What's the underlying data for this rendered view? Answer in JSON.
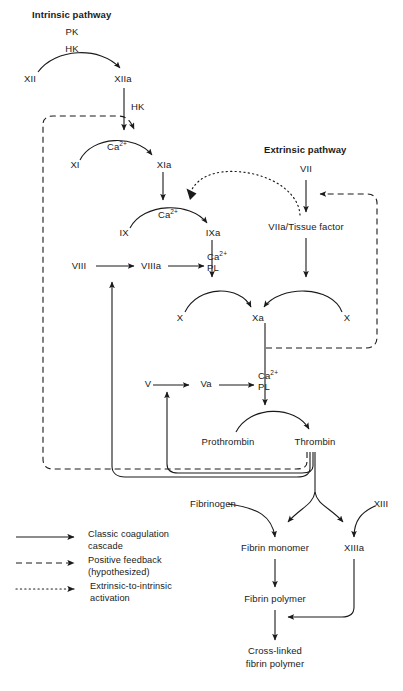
{
  "figure": {
    "type": "flow-diagram",
    "headings": {
      "intrinsic": "Intrinsic pathway",
      "extrinsic": "Extrinsic pathway"
    }
  },
  "nodes": {
    "pk": "PK",
    "hk_top": "HK",
    "xii": "XII",
    "xiia": "XIIa",
    "hk_arrow": "HK",
    "ca_xi": "Ca",
    "ca_xi_sup": "2+",
    "xi": "XI",
    "xia": "XIa",
    "ca_ix": "Ca",
    "ca_ix_sup": "2+",
    "ix": "IX",
    "ixa": "IXa",
    "vii": "VII",
    "viia_tf": "VIIa/Tissue factor",
    "viii": "VIII",
    "viiia": "VIIIa",
    "ca_x": "Ca",
    "ca_x_sup": "2+",
    "pl_x": "PL",
    "x_left": "X",
    "xa": "Xa",
    "x_right": "X",
    "v": "V",
    "va": "Va",
    "ca_pt": "Ca",
    "ca_pt_sup": "2+",
    "pl_pt": "PL",
    "prothrombin": "Prothrombin",
    "thrombin": "Thrombin",
    "fibrinogen": "Fibrinogen",
    "xiii": "XIII",
    "fibrin_monomer": "Fibrin monomer",
    "xiiia": "XIIIa",
    "fibrin_polymer": "Fibrin polymer",
    "crosslinked_line1": "Cross-linked",
    "crosslinked_line2": "fibrin polymer"
  },
  "legend": {
    "items": [
      {
        "style": "solid",
        "line1": "Classic coagulation",
        "line2": "cascade"
      },
      {
        "style": "dashed",
        "line1": "Positive feedback",
        "line2": "(hypothesized)"
      },
      {
        "style": "dotted",
        "line1": "Extrinsic-to-intrinsic",
        "line2": "activation"
      }
    ]
  },
  "colors": {
    "stroke": "#1a1a1a",
    "text": "#1a1a1a",
    "background": "#ffffff"
  }
}
